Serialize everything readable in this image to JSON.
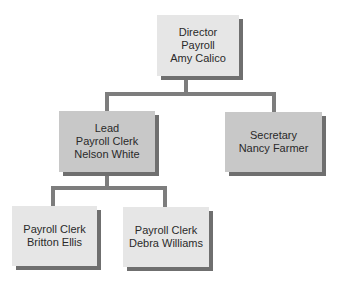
{
  "chart": {
    "type": "org-chart",
    "nodes": {
      "director": {
        "lines": [
          "Director",
          "Payroll",
          "Amy Calico"
        ]
      },
      "lead": {
        "lines": [
          "Lead",
          "Payroll Clerk",
          "Nelson White"
        ]
      },
      "secretary": {
        "lines": [
          "Secretary",
          "Nancy Farmer"
        ]
      },
      "clerk1": {
        "lines": [
          "Payroll Clerk",
          "Britton Ellis"
        ]
      },
      "clerk2": {
        "lines": [
          "Payroll Clerk",
          "Debra Williams"
        ]
      }
    },
    "edges": [
      [
        "director",
        "lead"
      ],
      [
        "director",
        "secretary"
      ],
      [
        "lead",
        "clerk1"
      ],
      [
        "lead",
        "clerk2"
      ]
    ],
    "colors": {
      "box_dark": "#c8c8c8",
      "box_light": "#e6e6e6",
      "shadow": "#6f6f6f",
      "connector": "#7d7d7d"
    }
  }
}
